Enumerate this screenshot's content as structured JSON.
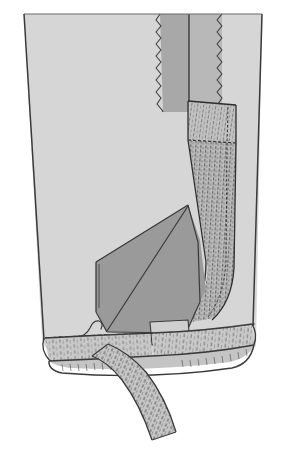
{
  "illustration": {
    "title": "Garment hem and side-seam zipper construction detail",
    "subject": "skirt-lower-corner-with-zipper-placket-and-bias-tape-hem",
    "style": "line-drawing-with-flat-gray-tones",
    "canvas": {
      "width": 282,
      "height": 460,
      "background": "#ffffff"
    },
    "palette": {
      "page_background": "#ffffff",
      "fabric_face_light": "#d6d6d6",
      "fabric_face_light_alt": "#dcdcdc",
      "fabric_wrong_side_mid": "#a8a8a8",
      "fabric_fold_dark": "#9a9a9a",
      "facing_strip": "#c2c2c2",
      "hem_band": "#c9c9c9",
      "tape_strip": "#c6c6c6",
      "outline": "#3a3a3a",
      "outline_soft": "#555555",
      "hatching": "#4a4a4a",
      "stitch_dots": "#2e2e2e"
    },
    "parts": [
      {
        "id": "garment-body",
        "label": "Garment body panel (right side of fabric)",
        "fill": "#d6d6d6"
      },
      {
        "id": "seam-allowance-left",
        "label": "Left seam allowance with pinked edge",
        "fill": "#a8a8a8"
      },
      {
        "id": "seam-allowance-right",
        "label": "Right seam allowance with pinked edge",
        "fill": "#b4b4b4"
      },
      {
        "id": "center-seam-line",
        "label": "Center back seam line",
        "stroke": "#3a3a3a"
      },
      {
        "id": "zipper-placket",
        "label": "Zipper tape / placket facing with hatched shading",
        "fill": "#c2c2c2"
      },
      {
        "id": "folded-flap",
        "label": "Folded-back corner flap (wrong side showing)",
        "fill": "#9a9a9a"
      },
      {
        "id": "hem-band",
        "label": "Turned-up hem band with hatching",
        "fill": "#c9c9c9"
      },
      {
        "id": "bias-tape",
        "label": "Hanging bias tape / seam binding strip",
        "fill": "#c6c6c6"
      },
      {
        "id": "stitch-line",
        "label": "Dashed machine stitching line along hem fold",
        "stroke": "#2e2e2e"
      },
      {
        "id": "thread-tail",
        "label": "Loose thread tail curl",
        "stroke": "#3a3a3a"
      }
    ],
    "edge_finishes": [
      {
        "id": "pinked-edge-left",
        "type": "zigzag",
        "teeth": 17
      },
      {
        "id": "pinked-edge-right",
        "type": "zigzag",
        "teeth": 17
      }
    ],
    "caption": ""
  }
}
